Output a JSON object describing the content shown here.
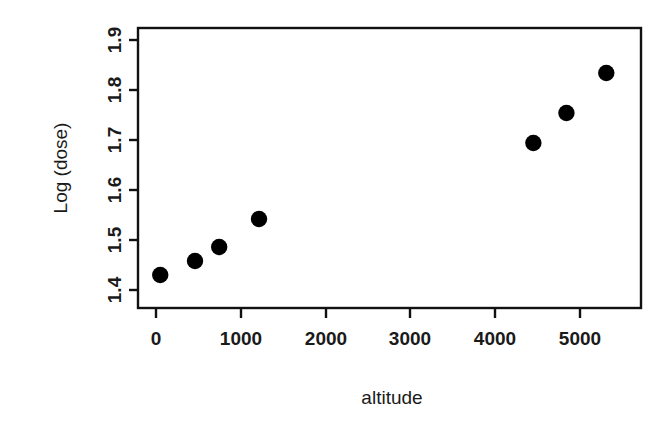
{
  "chart_data": {
    "type": "scatter",
    "title": "",
    "xlabel": "altitude",
    "ylabel": "Log (dose)",
    "xlim": [
      -235,
      5720
    ],
    "ylim": [
      1.3445,
      1.8555
    ],
    "xticks": [
      0,
      1000,
      2000,
      3000,
      4000,
      5000
    ],
    "xtick_labels": [
      "0",
      "1000",
      "2000",
      "3000",
      "4000",
      "5000"
    ],
    "yticks": [
      1.4,
      1.5,
      1.6,
      1.7,
      1.8,
      1.9
    ],
    "ytick_labels": [
      "1.4",
      "1.5",
      "1.6",
      "1.7",
      "1.8",
      "1.9"
    ],
    "grid": false,
    "legend": null,
    "series": [
      {
        "name": "",
        "marker": "filled-circle",
        "color": "#000000",
        "x": [
          50,
          460,
          745,
          1215,
          4450,
          4840,
          5310
        ],
        "y": [
          1.43,
          1.458,
          1.486,
          1.542,
          1.694,
          1.754,
          1.834
        ]
      }
    ],
    "points": [
      {
        "altitude": 50,
        "log_dose": 1.43
      },
      {
        "altitude": 460,
        "log_dose": 1.458
      },
      {
        "altitude": 745,
        "log_dose": 1.486
      },
      {
        "altitude": 1215,
        "log_dose": 1.542
      },
      {
        "altitude": 4450,
        "log_dose": 1.694
      },
      {
        "altitude": 4840,
        "log_dose": 1.754
      },
      {
        "altitude": 5310,
        "log_dose": 1.834
      }
    ]
  },
  "axes": {
    "x_title": "altitude",
    "y_title": "Log (dose)",
    "x_tick_labels": [
      "0",
      "1000",
      "2000",
      "3000",
      "4000",
      "5000"
    ],
    "y_tick_labels": [
      "1.4",
      "1.5",
      "1.6",
      "1.7",
      "1.8",
      "1.9"
    ]
  },
  "style": {
    "background": "#ffffff",
    "foreground": "#111111",
    "marker_color": "#000000"
  }
}
